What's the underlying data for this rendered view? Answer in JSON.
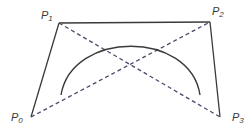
{
  "diagram": {
    "colors": {
      "background": "#ffffff",
      "solid_line": "#3a3a3a",
      "dashed_line": "#4a4a6a",
      "curve": "#3a3a3a",
      "label": "#3a3a3a"
    },
    "points": [
      {
        "id": "P0",
        "base": "P",
        "sub": "0",
        "x": 31,
        "y": 117,
        "label_x": 11,
        "label_y": 112
      },
      {
        "id": "P1",
        "base": "P",
        "sub": "1",
        "x": 59,
        "y": 23,
        "label_x": 41,
        "label_y": 10
      },
      {
        "id": "P2",
        "base": "P",
        "sub": "2",
        "x": 210,
        "y": 22,
        "label_x": 212,
        "label_y": 6
      },
      {
        "id": "P3",
        "base": "P",
        "sub": "3",
        "x": 220,
        "y": 117,
        "label_x": 232,
        "label_y": 112
      }
    ],
    "solid_edges": [
      {
        "from": "P0",
        "to": "P1"
      },
      {
        "from": "P1",
        "to": "P2"
      },
      {
        "from": "P2",
        "to": "P3"
      }
    ],
    "dashed_edges": [
      {
        "from": "P0",
        "to": "P2"
      },
      {
        "from": "P1",
        "to": "P3"
      }
    ],
    "curve": {
      "start": [
        61,
        95
      ],
      "control1": [
        72,
        30
      ],
      "control2": [
        190,
        30
      ],
      "end": [
        200,
        95
      ]
    }
  }
}
